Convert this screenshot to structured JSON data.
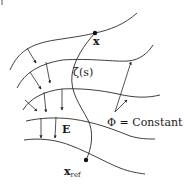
{
  "figure": {
    "labels": {
      "point_x": "x",
      "path": "ζ(s)",
      "field": "E",
      "point_ref": "x",
      "point_ref_sub": "ref",
      "equipotential": "Φ = Constant"
    },
    "colors": {
      "stroke": "#2a2a2a",
      "background": "#ffffff"
    }
  }
}
